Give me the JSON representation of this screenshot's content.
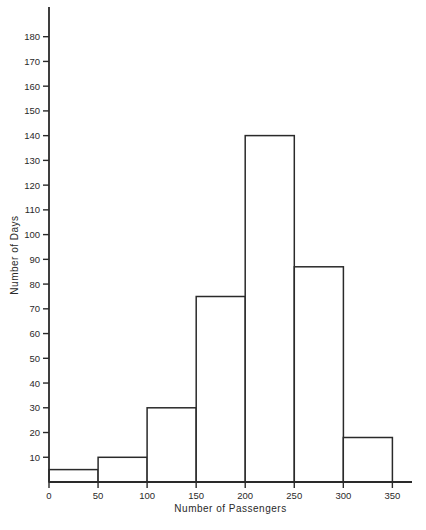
{
  "figure": {
    "background": "#ffffff",
    "ink_color": "#2a2a2a"
  },
  "chart_data": {
    "type": "histogram",
    "title": "",
    "xlabel": "Number of Passengers",
    "ylabel": "Number of Days",
    "bin_edges": [
      0,
      50,
      100,
      150,
      200,
      250,
      300,
      350
    ],
    "values": [
      5,
      10,
      30,
      75,
      140,
      87,
      18
    ],
    "x_ticks": [
      0,
      50,
      100,
      150,
      200,
      250,
      300,
      350
    ],
    "y_ticks": [
      10,
      20,
      30,
      40,
      50,
      60,
      70,
      80,
      90,
      100,
      110,
      120,
      130,
      140,
      150,
      160,
      170,
      180
    ],
    "xlim": [
      0,
      370
    ],
    "ylim": [
      0,
      192
    ],
    "grid": false,
    "legend": null,
    "bar_fill": "#ffffff",
    "bar_stroke": "#2a2a2a"
  }
}
